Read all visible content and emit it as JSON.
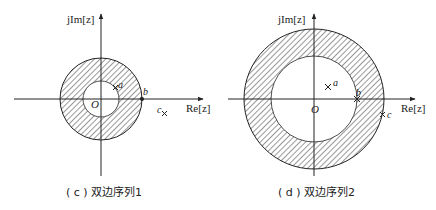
{
  "diagrams": [
    {
      "id": "c",
      "caption": "( c ) 双边序列1",
      "axis_x_label": "Re[z]",
      "axis_y_label": "jIm[z]",
      "origin_label": "O",
      "points": [
        {
          "label": "a",
          "kind": "pole-x",
          "position": "on inner circle, upper right"
        },
        {
          "label": "b",
          "kind": "dot",
          "position": "on outer circle, real axis"
        },
        {
          "label": "c",
          "kind": "pole-x",
          "position": "outside outer circle, below real axis"
        }
      ],
      "region": "annulus (hatched) between |a| and |b|"
    },
    {
      "id": "d",
      "caption": "( d ) 双边序列2",
      "axis_x_label": "Re[z]",
      "axis_y_label": "jIm[z]",
      "origin_label": "O",
      "points": [
        {
          "label": "a",
          "kind": "pole-x",
          "position": "inside inner circle, upper right"
        },
        {
          "label": "b",
          "kind": "pole-x",
          "position": "on inner circle, real axis"
        },
        {
          "label": "c",
          "kind": "pole-x",
          "position": "on outer circle, lower right"
        }
      ],
      "region": "annulus (hatched) between |b| and |c|"
    }
  ],
  "colors": {
    "stroke": "#222222",
    "hatch": "#333333",
    "background": "#ffffff"
  }
}
